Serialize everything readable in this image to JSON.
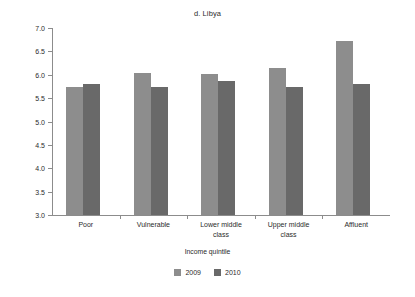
{
  "chart_data": {
    "type": "bar",
    "title": "d. Libya",
    "xlabel": "Income quintile",
    "ylabel": "Life evaluation score",
    "categories": [
      "Poor",
      "Vulnerable",
      "Lower middle class",
      "Upper middle class",
      "Affluent"
    ],
    "category_lines": [
      [
        "Poor"
      ],
      [
        "Vulnerable"
      ],
      [
        "Lower middle",
        "class"
      ],
      [
        "Upper middle",
        "class"
      ],
      [
        "Affluent"
      ]
    ],
    "series": [
      {
        "name": "2009",
        "color": "#8d8d8d",
        "values": [
          5.74,
          6.04,
          6.02,
          6.15,
          6.72
        ]
      },
      {
        "name": "2010",
        "color": "#696969",
        "values": [
          5.8,
          5.74,
          5.87,
          5.73,
          5.8
        ]
      }
    ],
    "ylim": [
      3.0,
      7.0
    ],
    "yticks": [
      "3.0",
      "3.5",
      "4.0",
      "4.5",
      "5.0",
      "5.5",
      "6.0",
      "6.5",
      "7.0"
    ],
    "ytick_values": [
      3.0,
      3.5,
      4.0,
      4.5,
      5.0,
      5.5,
      6.0,
      6.5,
      7.0
    ],
    "grid": false,
    "legend_position": "bottom"
  }
}
